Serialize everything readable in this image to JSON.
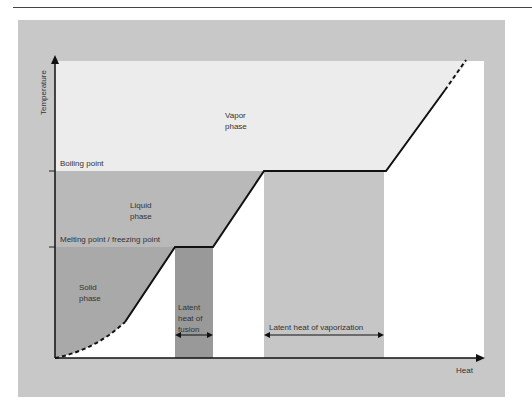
{
  "diagram": {
    "axes": {
      "y_label": "Temperature",
      "x_label": "Heat"
    },
    "levels": {
      "boiling": "Boiling point",
      "melting": "Melting point / freezing point"
    },
    "regions": {
      "vapor": [
        "Vapor",
        "phase"
      ],
      "liquid": [
        "Liquid",
        "phase"
      ],
      "solid": [
        "Solid",
        "phase"
      ]
    },
    "latent": {
      "fusion": [
        "Latent",
        "heat of",
        "fusion"
      ],
      "vaporization": "Latent heat of vaporization"
    },
    "colors": {
      "frame": "#c8c8c8",
      "vapor": "#ececec",
      "liquid": "#b9b9b9",
      "solid": "#a9a9a9",
      "fusion_bar": "#999999",
      "vapor_bar": "#c6c6c6"
    }
  }
}
